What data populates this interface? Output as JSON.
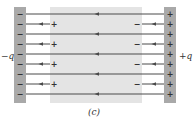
{
  "figure": {
    "caption": "(c)",
    "left_plate_label": "−q",
    "right_plate_label": "+q",
    "colors": {
      "plate": "#a9a9a9",
      "dielectric": "#e4e4e4",
      "line": "#4a4a4a",
      "text": "#333333"
    },
    "left_plate_sign": "−",
    "right_plate_sign": "+",
    "dielectric_left_sign": "+",
    "dielectric_right_sign": "−",
    "full_line_rows_y": [
      14,
      34,
      54,
      74,
      94
    ],
    "short_line_rows_y": [
      24,
      44,
      64,
      84
    ],
    "plate_sign_rows_y": [
      14,
      24,
      34,
      44,
      54,
      64,
      74,
      84,
      94
    ]
  }
}
